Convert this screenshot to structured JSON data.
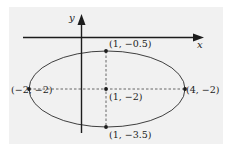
{
  "diagram": {
    "title": "",
    "type": "ellipse-with-axes",
    "colors": {
      "panel_background": "#f1f1f1",
      "stroke": "#1c1c1c",
      "dash": "#444444"
    },
    "axes": {
      "x_label": "x",
      "y_label": "y"
    },
    "ellipse": {
      "center": [
        1,
        -2
      ],
      "semi_major_horizontal": 3,
      "semi_minor_vertical": 1.5
    },
    "points": [
      {
        "id": "top",
        "label": "(1, −0.5)",
        "x": 1,
        "y": -0.5
      },
      {
        "id": "center",
        "label": "(1, −2)",
        "x": 1,
        "y": -2
      },
      {
        "id": "left",
        "label": "(−2, −2)",
        "x": -2,
        "y": -2
      },
      {
        "id": "right",
        "label": "(4, −2)",
        "x": 4,
        "y": -2
      },
      {
        "id": "bottom",
        "label": "(1, −3.5)",
        "x": 1,
        "y": -3.5
      }
    ]
  }
}
